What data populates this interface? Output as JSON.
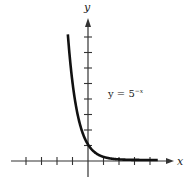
{
  "chart_data": {
    "type": "line",
    "title": "",
    "equation_label": "y = 5",
    "equation_exponent": "−x",
    "xlabel": "x",
    "ylabel": "y",
    "xlim": [
      -5,
      5.3
    ],
    "ylim": [
      -1,
      9.2
    ],
    "x_ticks": [
      -4,
      -3,
      -2,
      -1,
      1,
      2,
      3,
      4
    ],
    "y_ticks": [
      1,
      2,
      3,
      4,
      5,
      6,
      7,
      8
    ],
    "grid": false,
    "series": [
      {
        "name": "y = 5^-x",
        "x": [
          -1.3,
          -1.2,
          -1.0,
          -0.8,
          -0.6,
          -0.4,
          -0.2,
          0,
          0.5,
          1,
          2,
          3,
          4.5
        ],
        "y": [
          8.1,
          6.9,
          5.0,
          3.62,
          2.63,
          1.9,
          1.38,
          1.0,
          0.45,
          0.2,
          0.04,
          0.008,
          0.0007
        ]
      }
    ]
  }
}
